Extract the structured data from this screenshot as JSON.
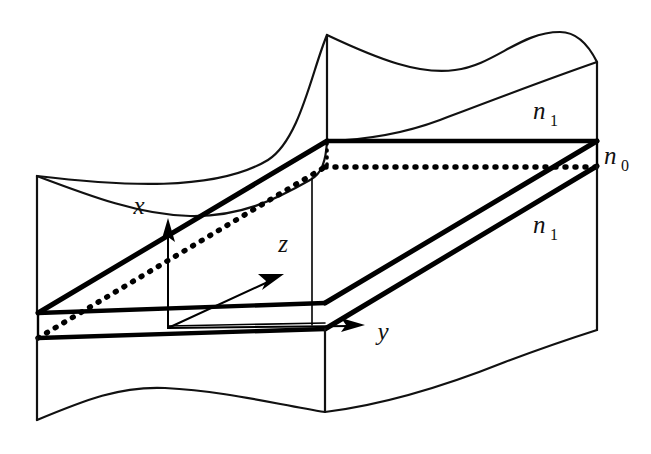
{
  "figure": {
    "background_color": "#ffffff",
    "line_color": "#111111",
    "thick_line_color": "#000000"
  },
  "labels": {
    "axis_x": "x",
    "axis_y": "y",
    "axis_z": "z",
    "index_cladding_top": "n",
    "index_cladding_top_sub": "1",
    "index_core": "n",
    "index_core_sub": "0",
    "index_cladding_bottom": "n",
    "index_cladding_bottom_sub": "1"
  },
  "label_positions": {
    "axis_x": {
      "x": 139,
      "y": 214
    },
    "axis_y": {
      "x": 377,
      "y": 340
    },
    "axis_z": {
      "x": 283,
      "y": 252
    },
    "index_cladding_top": {
      "x": 533,
      "y": 119
    },
    "index_core": {
      "x": 604,
      "y": 164
    },
    "index_cladding_bottom": {
      "x": 533,
      "y": 233
    }
  },
  "geometry": {
    "slab_front_top_left": {
      "x": 38,
      "y": 313
    },
    "slab_front_bottom_left": {
      "x": 38,
      "y": 338
    },
    "slab_front_top_right": {
      "x": 325,
      "y": 303
    },
    "slab_back_top_left": {
      "x": 327,
      "y": 141
    },
    "slab_back_top_right": {
      "x": 597,
      "y": 141
    },
    "slab_right_front_top": {
      "x": 597,
      "y": 166
    },
    "origin": {
      "x": 168,
      "y": 328
    },
    "x_axis_tip": {
      "x": 168,
      "y": 222
    },
    "y_axis_tip": {
      "x": 362,
      "y": 325
    },
    "z_axis_tip": {
      "x": 281,
      "y": 272
    },
    "left_edge_x": 37,
    "right_edge_x": 597,
    "top_peak_y": 35,
    "bottom_break_y": 420
  },
  "elements": {
    "top_cladding_block": "upper-cladding-region",
    "core_slab": "guiding-core-slab",
    "bottom_cladding_block": "lower-cladding-region",
    "hidden_edges": "dotted-hidden-edges",
    "break_lines": "wavy-break-edges"
  }
}
